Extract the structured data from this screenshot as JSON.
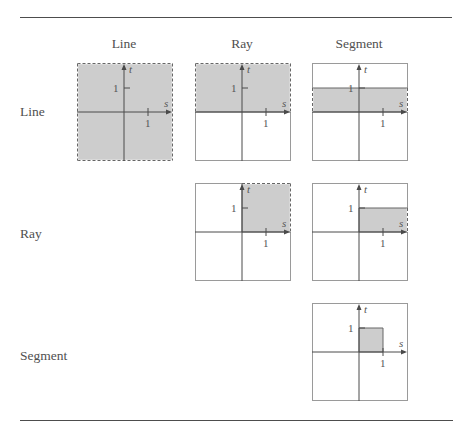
{
  "columns": [
    {
      "label": "Line"
    },
    {
      "label": "Ray"
    },
    {
      "label": "Segment"
    }
  ],
  "rows": [
    {
      "label": "Line",
      "cells": [
        {
          "region": {
            "s_min": null,
            "s_max": null,
            "t_min": null,
            "t_max": null
          }
        },
        {
          "region": {
            "s_min": null,
            "s_max": null,
            "t_min": 0,
            "t_max": null
          }
        },
        {
          "region": {
            "s_min": null,
            "s_max": null,
            "t_min": 0,
            "t_max": 1
          }
        }
      ]
    },
    {
      "label": "Ray",
      "cells": [
        null,
        {
          "region": {
            "s_min": 0,
            "s_max": null,
            "t_min": 0,
            "t_max": null
          }
        },
        {
          "region": {
            "s_min": 0,
            "s_max": null,
            "t_min": 0,
            "t_max": 1
          }
        }
      ]
    },
    {
      "label": "Segment",
      "cells": [
        null,
        null,
        {
          "region": {
            "s_min": 0,
            "s_max": 1,
            "t_min": 0,
            "t_max": 1
          }
        }
      ]
    }
  ],
  "axis": {
    "x_label": "s",
    "y_label": "t",
    "x_tick_label": "1",
    "y_tick_label": "1"
  },
  "colors": {
    "fill": "#cdcdcd",
    "axis": "#4a4a4a",
    "box_border": "#9a9a9a",
    "boundary": "#666666",
    "rule": "#4d4d4d"
  }
}
